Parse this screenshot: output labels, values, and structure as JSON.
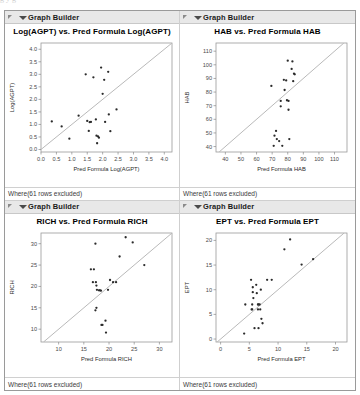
{
  "window": {
    "panel_header_label": "Graph Builder",
    "footer_note": "Where(61 rows excluded)",
    "accent_header_bg": "#e8e8e8",
    "point_color": "#2b2b2b",
    "reference_line_color": "#b9b9b9",
    "frame_color": "#9a9a9a"
  },
  "ghost_text": "g                                            y                                            g",
  "panels": [
    {
      "header": "Graph Builder",
      "footer": "Where(61 rows excluded)",
      "chart_data": {
        "type": "scatter",
        "title": "Log(AGPT) vs. Pred Formula Log(AGPT)",
        "xlabel": "Pred Formula Log(AGPT)",
        "ylabel": "Log(AGPT)",
        "xlim": [
          0.0,
          4.25
        ],
        "ylim": [
          -0.1,
          4.25
        ],
        "xticks": [
          0.0,
          0.5,
          1.0,
          1.5,
          2.0,
          2.5,
          3.0,
          3.5,
          4.0
        ],
        "yticks": [
          0.0,
          0.5,
          1.0,
          1.5,
          2.0,
          2.5,
          3.0,
          3.5,
          4.0
        ],
        "xticklabels": [
          "0.0",
          "0.5",
          "1.0",
          "1.5",
          "2.0",
          "2.5",
          "3.0",
          "3.5",
          "4.0"
        ],
        "yticklabels": [
          "0.0",
          "0.5",
          "1.0",
          "1.5",
          "2.0",
          "2.5",
          "3.0",
          "3.5",
          "4.0"
        ],
        "grid": false,
        "legend": "none",
        "reference_line": {
          "type": "identity",
          "from": [
            0.0,
            0.0
          ],
          "to": [
            4.25,
            4.25
          ]
        },
        "points": [
          [
            0.35,
            1.12
          ],
          [
            0.67,
            0.92
          ],
          [
            0.92,
            0.43
          ],
          [
            1.22,
            1.35
          ],
          [
            1.45,
            3.0
          ],
          [
            1.5,
            1.14
          ],
          [
            1.58,
            1.09
          ],
          [
            1.62,
            1.1
          ],
          [
            1.55,
            0.74
          ],
          [
            1.7,
            2.88
          ],
          [
            1.78,
            1.2
          ],
          [
            1.8,
            0.55
          ],
          [
            1.85,
            0.52
          ],
          [
            1.88,
            0.47
          ],
          [
            1.82,
            0.25
          ],
          [
            1.95,
            3.27
          ],
          [
            2.0,
            2.22
          ],
          [
            2.05,
            2.78
          ],
          [
            2.08,
            1.1
          ],
          [
            2.18,
            3.1
          ],
          [
            2.2,
            1.4
          ],
          [
            2.25,
            0.73
          ],
          [
            2.45,
            1.6
          ]
        ]
      }
    },
    {
      "header": "Graph Builder",
      "footer": "Where(61 rows excluded)",
      "chart_data": {
        "type": "scatter",
        "title": "HAB vs. Pred Formula HAB",
        "xlabel": "Pred Formula HAB",
        "ylabel": "HAB",
        "xlim": [
          34,
          118
        ],
        "ylim": [
          36,
          116
        ],
        "xticks": [
          40,
          50,
          60,
          70,
          80,
          90,
          100,
          110
        ],
        "yticks": [
          40,
          50,
          60,
          70,
          80,
          90,
          100,
          110
        ],
        "xticklabels": [
          "40",
          "50",
          "60",
          "70",
          "80",
          "90",
          "100",
          "110"
        ],
        "yticklabels": [
          "40",
          "50",
          "60",
          "70",
          "80",
          "90",
          "100",
          "110"
        ],
        "grid": false,
        "legend": "none",
        "reference_line": {
          "type": "identity",
          "from": [
            36,
            36
          ],
          "to": [
            116,
            116
          ]
        },
        "points": [
          [
            69.5,
            84.5
          ],
          [
            71.0,
            40.5
          ],
          [
            71.5,
            48.0
          ],
          [
            72.5,
            51.5
          ],
          [
            73.0,
            45.5
          ],
          [
            74.5,
            44.0
          ],
          [
            75.5,
            73.5
          ],
          [
            75.5,
            69.5
          ],
          [
            76.5,
            40.5
          ],
          [
            77.5,
            89.0
          ],
          [
            78.0,
            81.5
          ],
          [
            79.0,
            88.5
          ],
          [
            79.5,
            74.0
          ],
          [
            80.0,
            103.0
          ],
          [
            80.5,
            73.5
          ],
          [
            80.5,
            67.0
          ],
          [
            81.0,
            45.5
          ],
          [
            82.5,
            97.0
          ],
          [
            83.0,
            102.5
          ],
          [
            83.5,
            88.0
          ],
          [
            84.0,
            93.5
          ],
          [
            84.5,
            93.0
          ]
        ]
      }
    },
    {
      "header": "Graph Builder",
      "footer": "Where(61 rows excluded)",
      "chart_data": {
        "type": "scatter",
        "title": "RICH vs. Pred Formula RICH",
        "xlabel": "Pred Formula RICH",
        "ylabel": "RICH",
        "xlim": [
          6.5,
          32.5
        ],
        "ylim": [
          7.0,
          32.5
        ],
        "xticks": [
          10,
          15,
          20,
          25,
          30
        ],
        "yticks": [
          10,
          15,
          20,
          25,
          30
        ],
        "xticklabels": [
          "10",
          "15",
          "20",
          "25",
          "30"
        ],
        "yticklabels": [
          "10",
          "15",
          "20",
          "25",
          "30"
        ],
        "grid": false,
        "legend": "none",
        "reference_line": {
          "type": "identity",
          "from": [
            7.0,
            7.0
          ],
          "to": [
            32.5,
            32.5
          ]
        },
        "points": [
          [
            16.4,
            24.0
          ],
          [
            17.0,
            24.0
          ],
          [
            16.8,
            21.0
          ],
          [
            17.3,
            30.0
          ],
          [
            17.4,
            21.0
          ],
          [
            17.5,
            20.2
          ],
          [
            17.6,
            19.2
          ],
          [
            17.5,
            15.0
          ],
          [
            17.3,
            14.4
          ],
          [
            18.0,
            19.1
          ],
          [
            18.2,
            19.1
          ],
          [
            18.4,
            19.0
          ],
          [
            18.5,
            11.0
          ],
          [
            18.7,
            11.0
          ],
          [
            19.3,
            12.0
          ],
          [
            19.4,
            9.2
          ],
          [
            19.8,
            19.2
          ],
          [
            20.2,
            21.5
          ],
          [
            20.8,
            21.0
          ],
          [
            21.4,
            21.0
          ],
          [
            22.1,
            27.0
          ],
          [
            23.3,
            31.5
          ],
          [
            24.7,
            30.3
          ],
          [
            27.0,
            25.0
          ]
        ]
      }
    },
    {
      "header": "Graph Builder",
      "footer": "Where(61 rows excluded)",
      "chart_data": {
        "type": "scatter",
        "title": "EPT vs. Pred Formula EPT",
        "xlabel": "Pred Formula EPT",
        "ylabel": "EPT",
        "xlim": [
          -0.8,
          22.0
        ],
        "ylim": [
          -0.6,
          21.5
        ],
        "xticks": [
          0,
          5,
          10,
          15,
          20
        ],
        "yticks": [
          0,
          5,
          10,
          15,
          20
        ],
        "xticklabels": [
          "0",
          "5",
          "10",
          "15",
          "20"
        ],
        "yticklabels": [
          "0",
          "5",
          "10",
          "15",
          "20"
        ],
        "grid": false,
        "legend": "none",
        "reference_line": {
          "type": "identity",
          "from": [
            -0.6,
            -0.6
          ],
          "to": [
            21.5,
            21.5
          ]
        },
        "points": [
          [
            4.1,
            1.1
          ],
          [
            4.3,
            7.0
          ],
          [
            5.3,
            12.0
          ],
          [
            5.6,
            10.5
          ],
          [
            5.6,
            9.5
          ],
          [
            5.7,
            8.3
          ],
          [
            5.5,
            7.0
          ],
          [
            5.4,
            6.0
          ],
          [
            5.5,
            6.0
          ],
          [
            5.9,
            2.2
          ],
          [
            6.2,
            11.0
          ],
          [
            6.3,
            9.3
          ],
          [
            6.5,
            7.0
          ],
          [
            6.6,
            7.0
          ],
          [
            6.8,
            7.0
          ],
          [
            6.5,
            6.0
          ],
          [
            6.9,
            6.0
          ],
          [
            6.6,
            2.2
          ],
          [
            7.0,
            10.0
          ],
          [
            7.1,
            4.1
          ],
          [
            7.3,
            3.2
          ],
          [
            8.1,
            12.0
          ],
          [
            8.9,
            12.0
          ],
          [
            11.1,
            18.2
          ],
          [
            12.1,
            20.2
          ],
          [
            14.1,
            15.1
          ],
          [
            16.1,
            16.2
          ]
        ]
      }
    }
  ]
}
